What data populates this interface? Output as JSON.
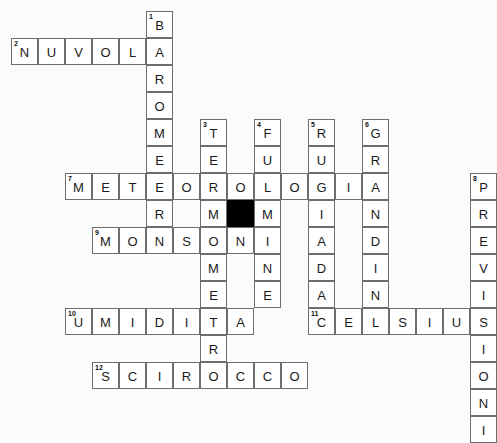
{
  "puzzle": {
    "title": "Cruciverba meteorologico",
    "language": "it",
    "grid": {
      "cell_size": 27,
      "origin_x": 11,
      "origin_y": 11,
      "black_cells": [
        {
          "col": 8,
          "row": 7
        }
      ]
    },
    "entries": [
      {
        "number": "1",
        "answer": "BAROMETRO",
        "direction": "down",
        "col": 5,
        "row": 0,
        "length": 9
      },
      {
        "number": "2",
        "answer": "NUVOLA",
        "direction": "across",
        "col": 0,
        "row": 1,
        "length": 6
      },
      {
        "number": "3",
        "answer": "TERMOMETRO",
        "direction": "down",
        "col": 7,
        "row": 4,
        "length": 10
      },
      {
        "number": "4",
        "answer": "FULMINE",
        "direction": "down",
        "col": 9,
        "row": 4,
        "length": 7
      },
      {
        "number": "5",
        "answer": "RUGIADA",
        "direction": "down",
        "col": 11,
        "row": 4,
        "length": 7
      },
      {
        "number": "6",
        "answer": "GRANDINE",
        "direction": "down",
        "col": 13,
        "row": 4,
        "length": 8
      },
      {
        "number": "7",
        "answer": "METEOROLOGIA",
        "direction": "across",
        "col": 2,
        "row": 6,
        "length": 12
      },
      {
        "number": "8",
        "answer": "PREVISIONI",
        "direction": "down",
        "col": 17,
        "row": 6,
        "length": 10
      },
      {
        "number": "9",
        "answer": "MONSONI",
        "direction": "across",
        "col": 3,
        "row": 8,
        "length": 7
      },
      {
        "number": "10",
        "answer": "UMIDITA",
        "direction": "across",
        "col": 2,
        "row": 11,
        "length": 7
      },
      {
        "number": "11",
        "answer": "CELSIUS",
        "direction": "across",
        "col": 11,
        "row": 11,
        "length": 7
      },
      {
        "number": "12",
        "answer": "SCIROCCO",
        "direction": "across",
        "col": 3,
        "row": 13,
        "length": 8
      }
    ],
    "colors": {
      "cell_fill": "#ffffff",
      "cell_border": "#6e6e6e",
      "block_fill": "#000000",
      "letter": "#1a1a1a",
      "page_background": "#fbfbfb"
    }
  }
}
